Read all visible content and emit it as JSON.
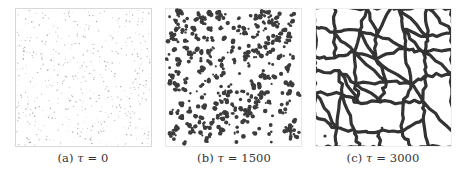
{
  "figure": {
    "panels": [
      {
        "id": "a",
        "label": "(a)",
        "symbol": "τ",
        "equals": "=",
        "value": "0",
        "pattern": "sparse-dots",
        "frame_color": "#d8d8d8",
        "ink_color": "#9a9a9a",
        "seed": 11,
        "count": 520,
        "radius": [
          0.35,
          0.8
        ]
      },
      {
        "id": "b",
        "label": "(b)",
        "symbol": "τ",
        "equals": "=",
        "value": "1500",
        "pattern": "blobs",
        "frame_color": "#e6e6e6",
        "ink_color": "#3c3c3c",
        "seed": 23,
        "count": 330,
        "radius": [
          1.0,
          2.4
        ]
      },
      {
        "id": "c",
        "label": "(c)",
        "symbol": "τ",
        "equals": "=",
        "value": "3000",
        "pattern": "network",
        "frame_color": "#eeeeee",
        "ink_color": "#333333",
        "seed": 37,
        "nodes": 42,
        "stroke_width": 3.2
      }
    ]
  }
}
